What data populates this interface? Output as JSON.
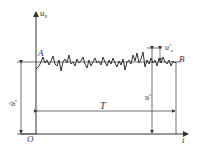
{
  "diagram": {
    "axes": {
      "y_label": "u",
      "y_label_sub": "x",
      "x_label": "t",
      "origin_label": "O"
    },
    "points": {
      "start_label": "A",
      "end_label": "B"
    },
    "dimensions": {
      "mean_label": "ū",
      "mean_label_sub": "x",
      "period_label": "T",
      "instant_label": "u",
      "instant_label_sub": "x",
      "fluctuation_label": "u′",
      "fluctuation_label_sub": "x"
    },
    "colors": {
      "line": "#333333",
      "background": "#ffffff"
    }
  }
}
